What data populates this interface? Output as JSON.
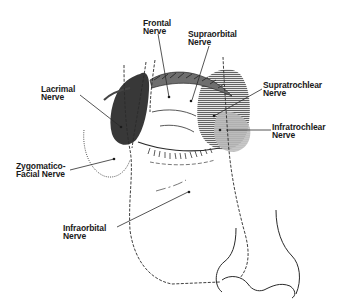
{
  "diagram": {
    "labels": {
      "frontal": "Frontal\nNerve",
      "supraorbital": "Supraorbital\nNerve",
      "lacrimal": "Lacrimal\nNerve",
      "supratrochlear": "Supratrochlear\nNerve",
      "infratrochlear": "Infratrochlear\nNerve",
      "zygomaticofacial": "Zygomatico-\nFacial Nerve",
      "infraorbital": "Infraorbital\nNerve"
    },
    "colors": {
      "line": "#2a2a2a",
      "lacrimal_fill": "#3a3a3a",
      "supratrochlear_fill": "#8a8a8a",
      "infratrochlear_fill": "#b5b5b5",
      "background": "#ffffff"
    }
  }
}
